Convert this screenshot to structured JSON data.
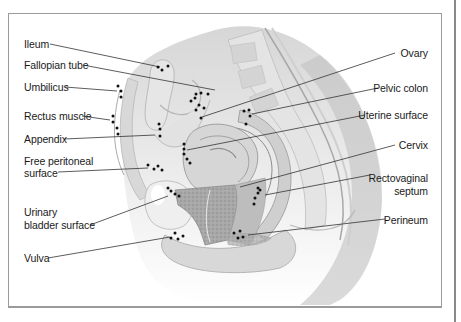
{
  "figure": {
    "labels_left": [
      {
        "id": "ileum",
        "text": "Ileum",
        "x": 24,
        "y": 38
      },
      {
        "id": "fallopian-tube",
        "text": "Fallopian tube",
        "x": 24,
        "y": 59
      },
      {
        "id": "umbilicus",
        "text": "Umbilicus",
        "x": 24,
        "y": 81
      },
      {
        "id": "rectus-muscle",
        "text": "Rectus muscle",
        "x": 24,
        "y": 110
      },
      {
        "id": "appendix",
        "text": "Appendix",
        "x": 24,
        "y": 133
      },
      {
        "id": "free-peritoneal-surface-1",
        "text": "Free peritoneal",
        "x": 24,
        "y": 155
      },
      {
        "id": "free-peritoneal-surface-2",
        "text": "surface",
        "x": 24,
        "y": 168
      },
      {
        "id": "urinary-bladder-surface-1",
        "text": "Urinary",
        "x": 24,
        "y": 206
      },
      {
        "id": "urinary-bladder-surface-2",
        "text": "bladder surface",
        "x": 24,
        "y": 219
      },
      {
        "id": "vulva",
        "text": "Vulva",
        "x": 24,
        "y": 253
      }
    ],
    "labels_right": [
      {
        "id": "ovary",
        "text": "Ovary",
        "right": 33,
        "y": 47
      },
      {
        "id": "pelvic-colon",
        "text": "Pelvic colon",
        "right": 33,
        "y": 82
      },
      {
        "id": "uterine-surface",
        "text": "Uterine surface",
        "right": 33,
        "y": 109
      },
      {
        "id": "cervix",
        "text": "Cervix",
        "right": 33,
        "y": 139
      },
      {
        "id": "rectovaginal-septum-1",
        "text": "Rectovaginal",
        "right": 33,
        "y": 172
      },
      {
        "id": "rectovaginal-septum-2",
        "text": "septum",
        "right": 33,
        "y": 185
      },
      {
        "id": "perineum",
        "text": "Perineum",
        "right": 33,
        "y": 214
      }
    ],
    "colors": {
      "frame": "#9a9a9a",
      "leader": "#333333",
      "dot": "#111111",
      "tissue_light": "#e9e9e9",
      "tissue_mid": "#c9c9c9",
      "tissue_dark": "#9d9d9d"
    }
  }
}
